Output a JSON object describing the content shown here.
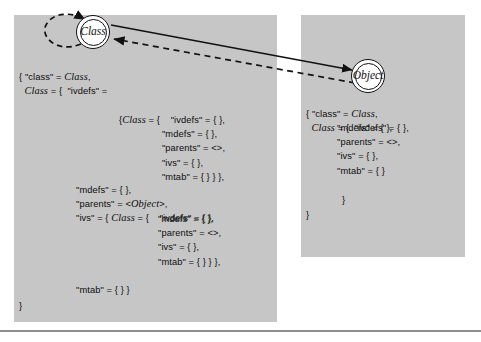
{
  "figure": {
    "type": "object-graph-diagram",
    "background_color": "#ffffff",
    "panel_color": "#c6c6c6"
  },
  "nodes": [
    {
      "id": "class",
      "label": "Class",
      "shape": "double-circle"
    },
    {
      "id": "object",
      "label": "Object",
      "shape": "double-circle"
    }
  ],
  "edges": [
    {
      "from": "class",
      "to": "class",
      "style": "dashed",
      "kind": "self-loop"
    },
    {
      "from": "class",
      "to": "object",
      "style": "solid"
    },
    {
      "from": "object",
      "to": "class",
      "style": "dashed"
    }
  ],
  "left_panel": {
    "block_a": [
      "{ \"class\" = Class,",
      "  Class = {  \"ivdefs\" ="
    ],
    "block_b": [
      "{Class = {    \"ivdefs\" = { },",
      "                \"mdefs\" = { },",
      "                \"parents\" = <>,",
      "                \"ivs\" = { },",
      "                \"mtab\" = { } } },"
    ],
    "block_c": [
      "\"mdefs\" = { },",
      "\"parents\" = <Object>,",
      "\"ivs\" = { Class = {    \"ivdefs\" = { },"
    ],
    "block_d": [
      "\"mdefs\" = { },",
      "\"parents\" = <>,",
      "\"ivs\" = { },",
      "\"mtab\" = { } } },"
    ],
    "block_e": [
      "\"mtab\" = { } }"
    ],
    "block_f": [
      "}"
    ]
  },
  "right_panel": {
    "block_a": [
      "{ \"class\" = Class,",
      "  Class = {  \"ivdefs\" = { },"
    ],
    "block_b": [
      "\"mdefs\" = { },",
      "\"parents\" = <>,",
      "\"ivs\" = { },",
      "\"mtab\" = { }"
    ],
    "block_c": [
      "}"
    ],
    "block_d": [
      "}"
    ]
  },
  "italic_terms": [
    "Class",
    "Object"
  ]
}
